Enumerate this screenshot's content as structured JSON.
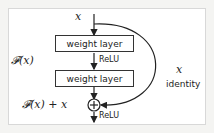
{
  "diagram": {
    "input_label": "x",
    "layer1_label": "weight layer",
    "relu1_label": "ReLU",
    "layer2_label": "weight layer",
    "function_label": "𝓕(x)",
    "skip_x_label": "x",
    "skip_identity_label": "identity",
    "sum_label": "𝓕(x) + x",
    "relu2_label": "ReLU",
    "sum_symbol": "+"
  }
}
